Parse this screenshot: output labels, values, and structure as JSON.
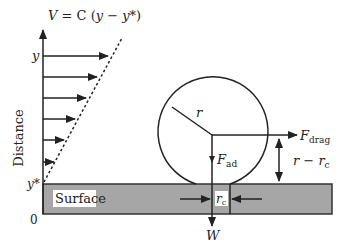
{
  "equation": {
    "V": "V",
    "eq": " = C (",
    "y": "y",
    "minus": " − ",
    "ystar": "y*",
    "close": ")"
  },
  "axis": {
    "label": "Distance",
    "y_tick": "y",
    "ystar_tick": "y*",
    "origin": "0"
  },
  "surface": {
    "label": "Surface",
    "fill_color": "#a6a6a6"
  },
  "particle": {
    "radius_label": "r",
    "contact_label": "r",
    "contact_sub": "c"
  },
  "forces": {
    "drag": "F",
    "drag_sub": "drag",
    "adhesion": "F",
    "adhesion_sub": "ad",
    "weight": "W"
  },
  "lever_arm": {
    "r": "r",
    "minus": " − ",
    "rc": "r",
    "rc_sub": "c"
  },
  "velocity_profile": {
    "arrow_count": 6
  }
}
